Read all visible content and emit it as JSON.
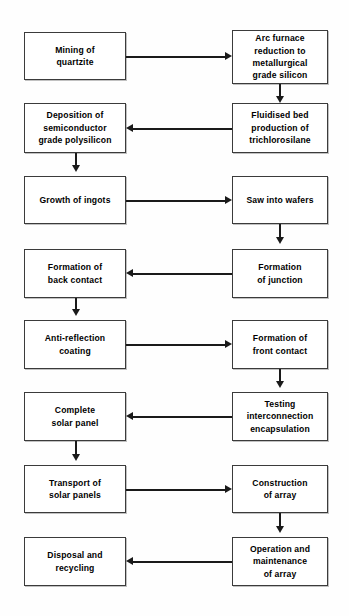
{
  "diagram": {
    "background_color": "#fefefe",
    "box_border_color": "#3b3b3b",
    "arrow_color": "#1a1a1a",
    "text_color": "#000000",
    "nodes": [
      {
        "id": "n1",
        "label": "Mining of\nquartzite",
        "column": "left",
        "row": 1
      },
      {
        "id": "n2",
        "label": "Arc furnace\nreduction to\nmetallurgical\ngrade silicon",
        "column": "right",
        "row": 1
      },
      {
        "id": "n3",
        "label": "Fluidised bed\nproduction of\ntrichlorosilane",
        "column": "right",
        "row": 2
      },
      {
        "id": "n4",
        "label": "Deposition of\nsemiconductor\ngrade polysilicon",
        "column": "left",
        "row": 2
      },
      {
        "id": "n5",
        "label": "Growth of ingots",
        "column": "left",
        "row": 3
      },
      {
        "id": "n6",
        "label": "Saw into wafers",
        "column": "right",
        "row": 3
      },
      {
        "id": "n7",
        "label": "Formation\nof junction",
        "column": "right",
        "row": 4
      },
      {
        "id": "n8",
        "label": "Formation of\nback contact",
        "column": "left",
        "row": 4
      },
      {
        "id": "n9",
        "label": "Anti-reflection\ncoating",
        "column": "left",
        "row": 5
      },
      {
        "id": "n10",
        "label": "Formation of\nfront contact",
        "column": "right",
        "row": 5
      },
      {
        "id": "n11",
        "label": "Testing\ninterconnection\nencapsulation",
        "column": "right",
        "row": 6
      },
      {
        "id": "n12",
        "label": "Complete\nsolar panel",
        "column": "left",
        "row": 6
      },
      {
        "id": "n13",
        "label": "Transport of\nsolar panels",
        "column": "left",
        "row": 7
      },
      {
        "id": "n14",
        "label": "Construction\nof array",
        "column": "right",
        "row": 7
      },
      {
        "id": "n15",
        "label": "Operation and\nmaintenance\nof array",
        "column": "right",
        "row": 8
      },
      {
        "id": "n16",
        "label": "Disposal and\nrecycling",
        "column": "left",
        "row": 8
      }
    ],
    "edges": [
      {
        "from": "n1",
        "to": "n2",
        "direction": "right"
      },
      {
        "from": "n2",
        "to": "n3",
        "direction": "down"
      },
      {
        "from": "n3",
        "to": "n4",
        "direction": "left"
      },
      {
        "from": "n4",
        "to": "n5",
        "direction": "down"
      },
      {
        "from": "n5",
        "to": "n6",
        "direction": "right"
      },
      {
        "from": "n6",
        "to": "n7",
        "direction": "down"
      },
      {
        "from": "n7",
        "to": "n8",
        "direction": "left"
      },
      {
        "from": "n8",
        "to": "n9",
        "direction": "down"
      },
      {
        "from": "n9",
        "to": "n10",
        "direction": "right"
      },
      {
        "from": "n10",
        "to": "n11",
        "direction": "down"
      },
      {
        "from": "n11",
        "to": "n12",
        "direction": "left"
      },
      {
        "from": "n12",
        "to": "n13",
        "direction": "down"
      },
      {
        "from": "n13",
        "to": "n14",
        "direction": "right"
      },
      {
        "from": "n14",
        "to": "n15",
        "direction": "down"
      },
      {
        "from": "n15",
        "to": "n16",
        "direction": "left"
      }
    ]
  }
}
